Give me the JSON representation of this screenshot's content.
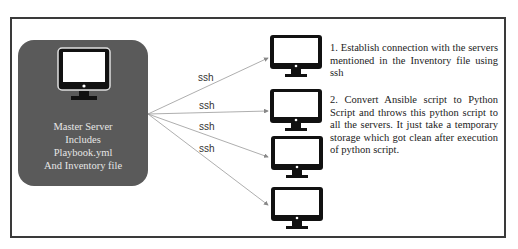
{
  "master": {
    "title": "Master Server",
    "lines": [
      "Master Server",
      "Includes",
      "Playbook.yml",
      "And Inventory file"
    ],
    "color": "#5a5a5a"
  },
  "connections": [
    {
      "label": "ssh",
      "target": "server-1"
    },
    {
      "label": "ssh",
      "target": "server-2"
    },
    {
      "label": "ssh",
      "target": "server-3"
    },
    {
      "label": "ssh",
      "target": "server-4"
    }
  ],
  "servers": [
    {
      "id": "server-1",
      "icon": "monitor-icon"
    },
    {
      "id": "server-2",
      "icon": "monitor-icon"
    },
    {
      "id": "server-3",
      "icon": "monitor-icon"
    },
    {
      "id": "server-4",
      "icon": "monitor-icon"
    }
  ],
  "steps": [
    {
      "text": "1. Establish connection with the servers mentioned in the Inventory file using ssh"
    },
    {
      "text": "2. Convert Ansible script to Python Script and throws this python script to all the servers. It just take a temporary storage which got clean after execution of python script."
    }
  ]
}
